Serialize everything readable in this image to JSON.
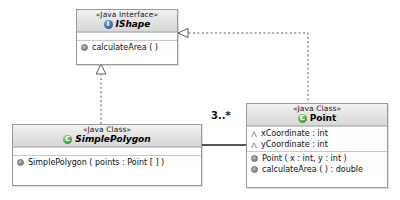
{
  "diagram": {
    "type": "uml-class-diagram"
  },
  "classifiers": {
    "ishape": {
      "stereotype": "«Java Interface»",
      "name": "IShape",
      "icon": "java-interface-icon",
      "members": [
        {
          "label": "calculateArea ( )",
          "icon": "method-icon"
        }
      ]
    },
    "simple_polygon": {
      "stereotype": "«Java Class»",
      "name": "SimplePolygon",
      "icon": "java-class-icon",
      "members": [
        {
          "label": "SimplePolygon ( points : Point [ ] )",
          "icon": "method-icon"
        }
      ]
    },
    "point": {
      "stereotype": "«Java Class»",
      "name": "Point",
      "icon": "java-class-icon",
      "attributes": [
        {
          "label": "xCoordinate : int",
          "icon": "protected-attribute-icon"
        },
        {
          "label": "yCoordinate : int",
          "icon": "protected-attribute-icon"
        }
      ],
      "operations": [
        {
          "label": "Point ( x : int, y : int )",
          "icon": "method-icon"
        },
        {
          "label": "calculateArea ( ) : double",
          "icon": "method-icon"
        }
      ]
    }
  },
  "relationships": {
    "polygon_realizes_ishape": {
      "kind": "realization",
      "line": "dashed",
      "arrow": "hollow-triangle"
    },
    "point_realizes_ishape": {
      "kind": "realization",
      "line": "dashed",
      "arrow": "hollow-triangle"
    },
    "polygon_point_association": {
      "kind": "association",
      "line": "solid",
      "multiplicity": "3..*"
    }
  },
  "colors": {
    "border": "#9a9a9a",
    "header_top": "#f3f3f3",
    "header_bottom": "#d8d8d8",
    "body": "#fdfdfd",
    "interface_icon": "#2e5c96",
    "class_icon": "#3f8f3a",
    "line": "#5a5a5a"
  }
}
